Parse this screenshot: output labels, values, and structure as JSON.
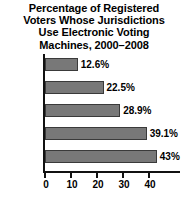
{
  "chart_data": {
    "type": "bar",
    "orientation": "horizontal",
    "title": "Percentage of Registered Voters Whose Jurisdictions Use Electronic Voting Machines, 2000–2008",
    "title_lines": [
      "Percentage of Registered",
      "Voters Whose Jurisdictions",
      "Use Electronic Voting",
      "Machines, 2000–2008"
    ],
    "categories": [
      "2000",
      "2002",
      "2003",
      "2006",
      "2008"
    ],
    "values": [
      12.6,
      22.5,
      28.9,
      39.1,
      43
    ],
    "value_labels": [
      "12.6%",
      "22.5%",
      "28.9%",
      "39.1%",
      "43%"
    ],
    "xlabel": "",
    "ylabel": "",
    "xlim": [
      0,
      52
    ],
    "xticks": [
      0,
      10,
      20,
      30,
      40
    ],
    "xtick_labels": [
      "0",
      "10",
      "20",
      "30",
      "40"
    ],
    "grid": false,
    "legend": false,
    "bar_color": "#787878",
    "bar_edge_color": "#3a3a3a",
    "axis_color": "#111111",
    "text_color": "#000000",
    "background": "#ffffff"
  }
}
